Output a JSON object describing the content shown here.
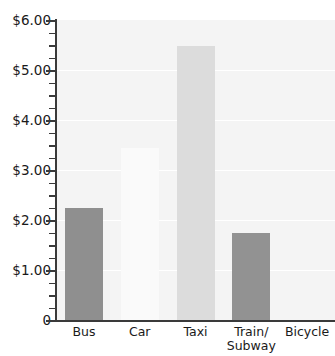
{
  "chart_data": {
    "type": "bar",
    "title": "",
    "xlabel": "",
    "ylabel": "",
    "categories": [
      "Bus",
      "Car",
      "Taxi",
      "Train/\nSubway",
      "Bicycle"
    ],
    "values": [
      2.25,
      3.45,
      5.48,
      1.75,
      0
    ],
    "value_labels": [
      "$2.25",
      "$3.45",
      "$5.48",
      "$1.75",
      "$0.00"
    ],
    "ylim": [
      0,
      6
    ],
    "y_tick_labels": [
      "0",
      "$1.00",
      "$2.00",
      "$3.00",
      "$4.00",
      "$5.00",
      "$6.00"
    ],
    "y_tick_values": [
      0,
      1,
      2,
      3,
      4,
      5,
      6
    ],
    "y_minor_step": 0.25,
    "grid": true,
    "grid_color": "#ffffff",
    "legend": false,
    "legend_position": "none",
    "plot_background": "#f4f4f4",
    "axis_color": "#3a3a3a",
    "bar_colors": [
      "#8f8f8f",
      "#fafafa",
      "#dcdcdc",
      "#929292",
      "#f4f4f4"
    ]
  }
}
